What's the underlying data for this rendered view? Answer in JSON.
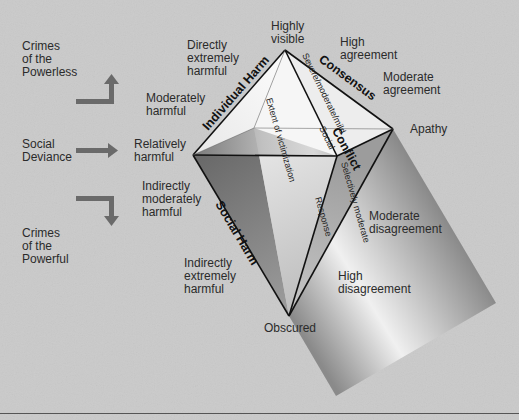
{
  "diagram": {
    "type": "pyramid-of-crime",
    "left_column": {
      "top": "Crimes\nof the\nPowerless",
      "middle": "Social\nDeviance",
      "bottom": "Crimes\nof the\nPowerful"
    },
    "edge_labels": {
      "individual_harm": "Individual Harm",
      "consensus": "Consensus",
      "social_harm": "Social Harm",
      "conflict": "Conflict"
    },
    "face_labels": {
      "extent": "Extent  of  victimization",
      "severe": "Severe/moderate/mild",
      "social": "Social",
      "selectively": "Selectively moderate",
      "response": "Response"
    },
    "harm_scale": [
      "Directly\nextremely\nharmful",
      "Moderately\nharmful",
      "Relatively\nharmful",
      "Indirectly\nmoderately\nharmful",
      "Indirectly\nextremely\nharmful"
    ],
    "visibility": {
      "top": "Highly\nvisible",
      "bottom": "Obscured"
    },
    "agreement_scale": [
      "High\nagreement",
      "Moderate\nagreement",
      "Apathy",
      "Moderate\ndisagreement",
      "High\ndisagreement"
    ],
    "colors": {
      "background": "#c9c9c9",
      "edge": "#111111",
      "arrow": "#6a6a6a",
      "face_light": "#f4f4f4",
      "face_dark": "#7a7a7a"
    }
  }
}
